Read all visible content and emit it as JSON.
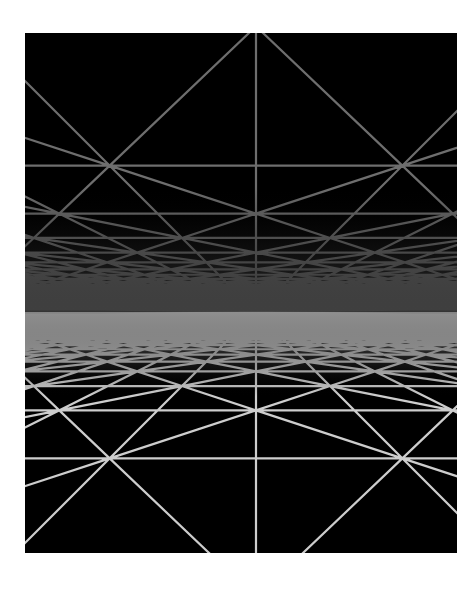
{
  "image": {
    "description": "Perspective wireframe grid of triangulated squares forming a ceiling and floor converging to a central horizon",
    "frame": {
      "x": 25,
      "y": 33,
      "width": 432,
      "height": 520
    },
    "background_color": "#000000",
    "page_background": "#ffffff"
  },
  "scene": {
    "horizon_y": 279,
    "vanishing_x": 231,
    "focal": 300,
    "ceiling": {
      "height": 1.0,
      "line_color": "#6e6e6e",
      "line_width": 2.2,
      "haze_color": "#3a3a3a"
    },
    "floor": {
      "height": 1.0,
      "line_color": "#cdcdcd",
      "line_width": 2.2,
      "haze_color": "#8c8c8c"
    },
    "grid_cell": 1.0,
    "columns": 60,
    "depth_rows": 120,
    "near_z": 1.05
  }
}
